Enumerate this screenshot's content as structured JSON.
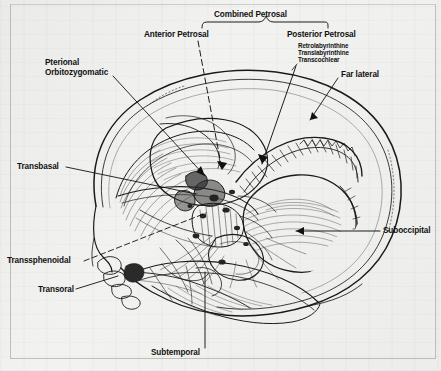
{
  "figure": {
    "kind": "anatomical-illustration",
    "background_color": "#f2f2f0",
    "ink_color": "#1a1a1a"
  },
  "bracket": {
    "label": "Combined Petrosal",
    "name": "combined-petrosal-bracket"
  },
  "labels": [
    {
      "id": "anterior-petrosal",
      "text": "Anterior Petrosal",
      "x": 144,
      "y": 36,
      "align": "left"
    },
    {
      "id": "posterior-petrosal",
      "text": "Posterior Petrosal",
      "x": 287,
      "y": 36,
      "align": "left"
    },
    {
      "id": "retrolabyrinthine",
      "text": "Retrolabyrinthine",
      "x": 298,
      "y": 47,
      "align": "left",
      "size": "small"
    },
    {
      "id": "translabyrinthine",
      "text": "Translabyrinthine",
      "x": 298,
      "y": 54,
      "align": "left",
      "size": "small"
    },
    {
      "id": "transcochlear",
      "text": "Transcochlear",
      "x": 298,
      "y": 61,
      "align": "left",
      "size": "small"
    },
    {
      "id": "far-lateral",
      "text": "Far lateral",
      "x": 341,
      "y": 74,
      "align": "left"
    },
    {
      "id": "pterional",
      "text": "Pterional",
      "x": 45,
      "y": 62,
      "align": "left"
    },
    {
      "id": "orbitozygomatic",
      "text": "Orbitozygomatic",
      "x": 45,
      "y": 72,
      "align": "left"
    },
    {
      "id": "transbasal",
      "text": "Transbasal",
      "x": 17,
      "y": 164,
      "align": "left"
    },
    {
      "id": "transsphenoidal",
      "text": "Transsphenoidal",
      "x": 7,
      "y": 258,
      "align": "left"
    },
    {
      "id": "transoral",
      "text": "Transoral",
      "x": 38,
      "y": 289,
      "align": "left"
    },
    {
      "id": "suboccipital",
      "text": "Suboccipital",
      "x": 383,
      "y": 228,
      "align": "left"
    },
    {
      "id": "subtemporal",
      "text": "Subtemporal",
      "x": 151,
      "y": 352,
      "align": "left"
    }
  ],
  "colors": {
    "ink": "#1a1a1a",
    "leader": "#111111",
    "hatch": "#3a3a3a",
    "paper": "#f2f2f0",
    "frame": "#787878"
  }
}
